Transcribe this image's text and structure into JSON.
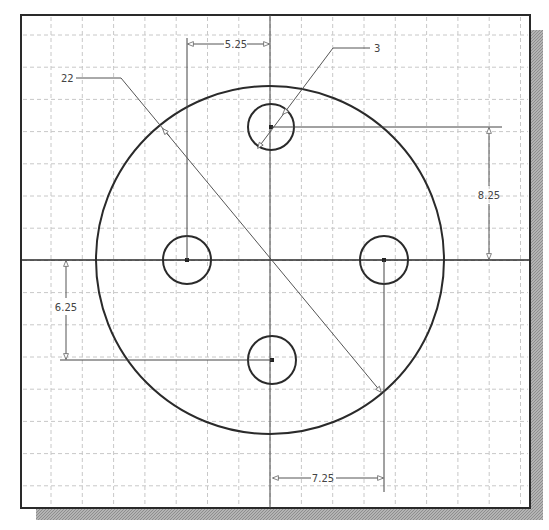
{
  "drawing": {
    "title": "Circular plate with four holes - dimensioned sketch",
    "frame": {
      "x": 21,
      "y": 15,
      "width": 509,
      "height": 493,
      "shadow_offset": 13
    },
    "grid": {
      "spacing_x": 31.3,
      "spacing_y": 32.2,
      "start_x": 51,
      "start_y": 35,
      "color": "#c8c8c8"
    },
    "colors": {
      "line": "#2a2a2a",
      "dim_line": "#555555",
      "shadow": "#a8a8a8",
      "background": "#ffffff"
    },
    "main_circle": {
      "cx": 270,
      "cy": 260,
      "r": 174,
      "label": "22"
    },
    "holes": [
      {
        "name": "top",
        "cx": 271,
        "cy": 127,
        "r": 23
      },
      {
        "name": "left",
        "cx": 187,
        "cy": 260,
        "r": 24
      },
      {
        "name": "right",
        "cx": 384,
        "cy": 260,
        "r": 24
      },
      {
        "name": "bottom",
        "cx": 272,
        "cy": 360,
        "r": 24
      }
    ],
    "dimensions": {
      "hole_diameter": "3",
      "main_diameter": "22",
      "left_offset": "5.25",
      "top_offset": "8.25",
      "bottom_offset": "6.25",
      "right_offset": "7.25"
    }
  }
}
